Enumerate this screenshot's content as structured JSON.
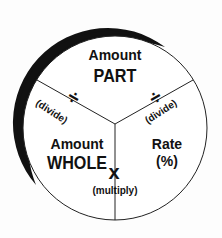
{
  "diagram": {
    "segments": {
      "top": {
        "line1": "Amount",
        "line2": "PART"
      },
      "left": {
        "line1": "Amount",
        "line2": "WHOLE"
      },
      "right": {
        "line1": "Rate",
        "line2": "(%)"
      }
    },
    "operators": {
      "left_divide": {
        "symbol": "÷",
        "label": "(divide)"
      },
      "right_divide": {
        "symbol": "÷",
        "label": "(divide)"
      },
      "multiply": {
        "symbol": "x",
        "label": "(multiply)"
      }
    },
    "colors": {
      "ink": "#111111",
      "background": "#fdfdfd"
    }
  }
}
